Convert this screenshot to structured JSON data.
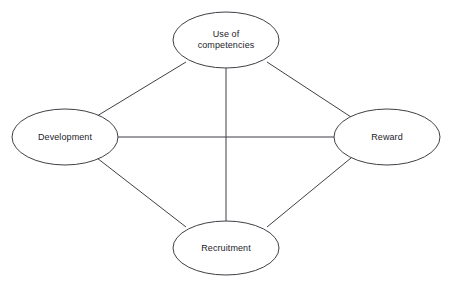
{
  "diagram": {
    "background_color": "#ffffff",
    "stroke_color": "#3f3f46",
    "text_color": "#23232a",
    "nodes": [
      {
        "id": "use-of-competencies",
        "label": "Use of\ncompetencies",
        "cx": 226,
        "cy": 40,
        "rx": 53,
        "ry": 28
      },
      {
        "id": "development",
        "label": "Development",
        "cx": 65,
        "cy": 137,
        "rx": 53,
        "ry": 28
      },
      {
        "id": "reward",
        "label": "Reward",
        "cx": 387,
        "cy": 137,
        "rx": 53,
        "ry": 28
      },
      {
        "id": "recruitment",
        "label": "Recruitment",
        "cx": 226,
        "cy": 248,
        "rx": 53,
        "ry": 27
      }
    ],
    "edges": [
      {
        "id": "edge-development-use-of-competencies",
        "from": "development",
        "to": "use-of-competencies",
        "x1": 97,
        "y1": 116,
        "x2": 186,
        "y2": 62
      },
      {
        "id": "edge-use-of-competencies-reward",
        "from": "use-of-competencies",
        "to": "reward",
        "x1": 267,
        "y1": 62,
        "x2": 351,
        "y2": 117
      },
      {
        "id": "edge-development-recruitment",
        "from": "development",
        "to": "recruitment",
        "x1": 97,
        "y1": 158,
        "x2": 186,
        "y2": 227
      },
      {
        "id": "edge-reward-recruitment",
        "from": "reward",
        "to": "recruitment",
        "x1": 351,
        "y1": 158,
        "x2": 267,
        "y2": 227
      },
      {
        "id": "edge-development-reward",
        "from": "development",
        "to": "reward",
        "x1": 118,
        "y1": 137,
        "x2": 334,
        "y2": 137
      },
      {
        "id": "edge-use-of-competencies-recruitment",
        "from": "use-of-competencies",
        "to": "recruitment",
        "x1": 226,
        "y1": 68,
        "x2": 226,
        "y2": 221
      }
    ]
  }
}
